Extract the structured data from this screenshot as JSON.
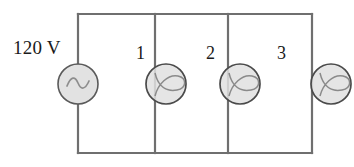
{
  "diagram": {
    "type": "electrical-circuit-schematic",
    "source": {
      "label": "120 V",
      "symbol": "ac-source-sine",
      "cx": 78,
      "cy": 84,
      "r": 20
    },
    "loads": [
      {
        "label": "1",
        "symbol": "incandescent-lamp",
        "cx": 166,
        "cy": 84,
        "r": 20,
        "branch_x": 155
      },
      {
        "label": "2",
        "symbol": "incandescent-lamp",
        "cx": 240,
        "cy": 84,
        "r": 20,
        "branch_x": 228
      },
      {
        "label": "3",
        "symbol": "incandescent-lamp",
        "cx": 331,
        "cy": 84,
        "r": 20,
        "branch_x": 312
      }
    ],
    "frame": {
      "left": 78,
      "right": 312,
      "top": 14,
      "bottom": 153
    },
    "colors": {
      "wire": "#6f6f6f",
      "component_outline": "#4a4a4a",
      "component_fill": "#e0e0e0",
      "filament": "#8a8a8a",
      "label_text": "#1a1a1a",
      "background": "#ffffff"
    }
  }
}
